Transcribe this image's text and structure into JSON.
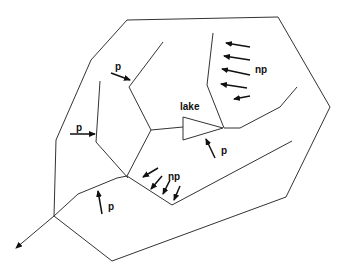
{
  "diagram": {
    "title": "",
    "colors": {
      "line": "#333333",
      "arrow": "#111111",
      "background": "#ffffff"
    },
    "labels": [
      {
        "id": "p1",
        "text": "p",
        "x": 115,
        "y": 70
      },
      {
        "id": "p2",
        "text": "p",
        "x": 76,
        "y": 131
      },
      {
        "id": "p3",
        "text": "p",
        "x": 108,
        "y": 210
      },
      {
        "id": "p4",
        "text": "p",
        "x": 221,
        "y": 154
      },
      {
        "id": "lake",
        "text": "lake",
        "x": 180,
        "y": 110
      },
      {
        "id": "np1",
        "text": "np",
        "x": 255,
        "y": 73
      },
      {
        "id": "np2",
        "text": "np",
        "x": 168,
        "y": 180
      }
    ],
    "arrows_description": {
      "p": "point-source inputs",
      "np": "non-point-source inputs",
      "outlet": "basin outlet arrow at lower left"
    }
  }
}
